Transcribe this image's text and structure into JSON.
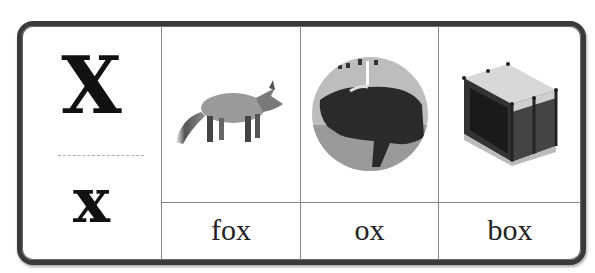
{
  "letter_card": {
    "uppercase": "X",
    "lowercase": "x",
    "items": [
      {
        "word": "fox",
        "image": "fox-image"
      },
      {
        "word": "ox",
        "image": "ox-image"
      },
      {
        "word": "box",
        "image": "box-image"
      }
    ]
  },
  "colors": {
    "border": "#3a3a3a",
    "grid": "#888888",
    "text": "#111111"
  }
}
